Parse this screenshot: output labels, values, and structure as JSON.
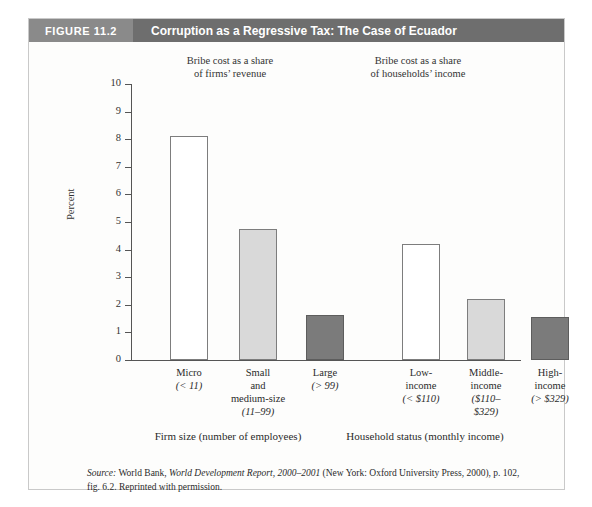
{
  "figure": {
    "number_label": "FIGURE 11.2",
    "title": "Corruption as a Regressive Tax: The Case of Ecuador"
  },
  "colors": {
    "header_band": "#6e6e6e",
    "header_number_box": "#8a8a8a",
    "bar_white": "#ffffff",
    "bar_light_gray": "#d9d9d9",
    "bar_dark_gray": "#7b7b7b",
    "axis": "#555555",
    "frame_border": "#c9c9c9"
  },
  "panel_notes": [
    "Bribe cost as a share\nof firms’ revenue",
    "Bribe cost as a share\nof households’ income"
  ],
  "categories_detail": [
    {
      "name": "Micro",
      "range": "(< 11)"
    },
    {
      "name": "Small\nand\nmedium-size",
      "range": "(11–99)"
    },
    {
      "name": "Large",
      "range": "(> 99)"
    },
    {
      "name": "Low-\nincome",
      "range": "(< $110)"
    },
    {
      "name": "Middle-\nincome",
      "range": "($110–\n$329)"
    },
    {
      "name": "High-\nincome",
      "range": "(> $329)"
    }
  ],
  "group_axis_labels": [
    "Firm size (number of employees)",
    "Household status (monthly income)"
  ],
  "source": {
    "label": "Source:",
    "text_1": " World Bank, ",
    "title": "World Development Report, 2000–2001",
    "text_2": " (New York: Oxford University Press, 2000), p. 102, fig. 6.2. Reprinted with permission."
  },
  "chart_data": {
    "type": "bar",
    "title": "Corruption as a Regressive Tax: The Case of Ecuador",
    "xlabel": "",
    "ylabel": "Percent",
    "ylim": [
      0,
      10
    ],
    "yticks": [
      0,
      1,
      2,
      3,
      4,
      5,
      6,
      7,
      8,
      9,
      10
    ],
    "grid": false,
    "legend": "none",
    "categories": [
      "Micro (< 11)",
      "Small and medium-size (11–99)",
      "Large (> 99)",
      "Low-income (< $110)",
      "Middle-income ($110–$329)",
      "High-income (> $329)"
    ],
    "values": [
      8.1,
      4.75,
      1.63,
      4.2,
      2.2,
      1.55
    ],
    "bar_styles": [
      "white",
      "light",
      "dark",
      "white",
      "light",
      "dark"
    ],
    "groups": [
      {
        "label": "Firm size (number of employees)",
        "note": "Bribe cost as a share of firms’ revenue",
        "categories": [
          "Micro (< 11)",
          "Small and medium-size (11–99)",
          "Large (> 99)"
        ],
        "values": [
          8.1,
          4.75,
          1.63
        ]
      },
      {
        "label": "Household status (monthly income)",
        "note": "Bribe cost as a share of households’ income",
        "categories": [
          "Low-income (< $110)",
          "Middle-income ($110–$329)",
          "High-income (> $329)"
        ],
        "values": [
          4.2,
          2.2,
          1.55
        ]
      }
    ]
  }
}
